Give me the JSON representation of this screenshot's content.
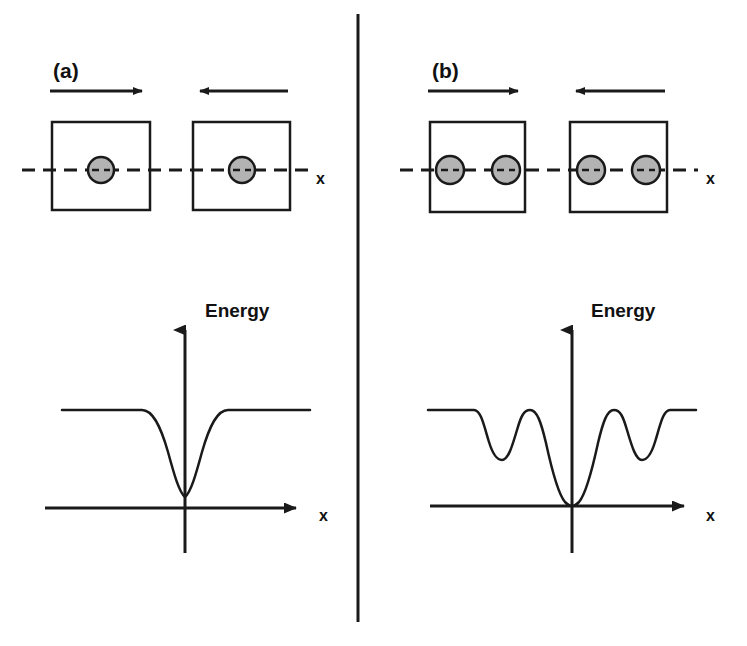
{
  "figure": {
    "background_color": "#ffffff",
    "stroke_color": "#1a1a1a",
    "particle_fill": "#b3b3b3",
    "particle_stroke": "#1a1a1a",
    "divider": {
      "name": "panel-divider",
      "x": 358,
      "y1": 14,
      "y2": 622,
      "width": 3
    }
  },
  "panels": [
    {
      "id": "a",
      "label": "(a)",
      "label_x": 53,
      "label_y": 78,
      "arrows": [
        {
          "name": "arrow-right",
          "direction": "right",
          "x1": 50,
          "x2": 148,
          "y": 91
        },
        {
          "name": "arrow-left",
          "direction": "left",
          "x1": 288,
          "x2": 194,
          "y": 91
        }
      ],
      "dashed_axis": {
        "name": "dashed-x-axis",
        "x1": 22,
        "x2": 308,
        "y": 170,
        "label": "x",
        "label_x": 316,
        "label_y": 184
      },
      "blocks": [
        {
          "name": "block-left",
          "x": 52,
          "y": 122,
          "width": 98,
          "height": 88,
          "particles": [
            {
              "name": "particle",
              "cx": 101,
              "cy": 170,
              "r": 13
            }
          ]
        },
        {
          "name": "block-right",
          "x": 193,
          "y": 122,
          "width": 97,
          "height": 88,
          "particles": [
            {
              "name": "particle",
              "cx": 242,
              "cy": 170,
              "r": 13
            }
          ]
        }
      ],
      "plot": {
        "name": "energy-plot-a",
        "energy_label": "Energy",
        "energy_label_x": 205,
        "energy_label_y": 317,
        "x_label": "x",
        "x_label_x": 319,
        "x_label_y": 521,
        "y_axis": {
          "x": 185,
          "y_top": 318,
          "y_bottom": 553
        },
        "x_axis": {
          "y": 508,
          "x_left": 45,
          "x_right": 308
        },
        "curve": "M62,410 L142,410 C152,410 160,424 168,452 C174,474 179,492 185,497 C191,492 196,474 202,452 C210,424 218,410 228,410 L310,410"
      },
      "chart_data": {
        "type": "line",
        "title": "Energy",
        "xlabel": "x",
        "ylabel": "Energy",
        "description": "Single commensurate contact: one broad potential well centered at x = 0, plateau at barrier height on both sides",
        "plateau_level": 1.0,
        "minimum_level": 0.12,
        "well_count": 1,
        "x": [
          -1.0,
          -0.62,
          -0.47,
          -0.32,
          -0.17,
          0.0,
          0.17,
          0.32,
          0.47,
          0.62,
          1.0
        ],
        "y": [
          1.0,
          1.0,
          0.84,
          0.55,
          0.22,
          0.12,
          0.22,
          0.55,
          0.84,
          1.0,
          1.0
        ]
      }
    },
    {
      "id": "b",
      "label": "(b)",
      "label_x": 432,
      "label_y": 78,
      "arrows": [
        {
          "name": "arrow-right",
          "direction": "right",
          "x1": 428,
          "x2": 524,
          "y": 91
        },
        {
          "name": "arrow-left",
          "direction": "left",
          "x1": 665,
          "x2": 570,
          "y": 91
        }
      ],
      "dashed_axis": {
        "name": "dashed-x-axis",
        "x1": 400,
        "x2": 698,
        "y": 170,
        "label": "x",
        "label_x": 706,
        "label_y": 184
      },
      "blocks": [
        {
          "name": "block-left",
          "x": 430,
          "y": 122,
          "width": 95,
          "height": 90,
          "particles": [
            {
              "name": "particle",
              "cx": 450,
              "cy": 170,
              "r": 14
            },
            {
              "name": "particle",
              "cx": 506,
              "cy": 170,
              "r": 14
            }
          ]
        },
        {
          "name": "block-right",
          "x": 570,
          "y": 122,
          "width": 97,
          "height": 90,
          "particles": [
            {
              "name": "particle",
              "cx": 591,
              "cy": 170,
              "r": 14
            },
            {
              "name": "particle",
              "cx": 646,
              "cy": 170,
              "r": 14
            }
          ]
        }
      ],
      "plot": {
        "name": "energy-plot-b",
        "energy_label": "Energy",
        "energy_label_x": 591,
        "energy_label_y": 317,
        "x_label": "x",
        "x_label_x": 706,
        "x_label_y": 521,
        "y_axis": {
          "x": 572,
          "y_top": 318,
          "y_bottom": 553
        },
        "x_axis": {
          "y": 506,
          "x_left": 430,
          "x_right": 696
        },
        "curve": "M428,410 L474,410 C481,410 484,426 489,442 C493,455 497,460 502,460 C508,460 512,447 517,430 C521,416 524,410 530,410 C537,410 541,422 546,443 C551,466 558,494 565,502 C568,505 570,506 572,506 C574,506 576,505 579,502 C586,494 593,466 598,443 C603,422 607,410 614,410 C620,410 623,416 627,430 C632,447 636,460 642,460 C647,460 651,455 655,442 C660,426 663,410 670,410 L696,410"
      },
      "chart_data": {
        "type": "line",
        "title": "Energy",
        "xlabel": "x",
        "ylabel": "Energy",
        "description": "Double asperity contact: deep central well at x = 0 flanked by two shallower side minima and two intermediate maxima at the plateau level",
        "plateau_level": 1.0,
        "minimum_level": 0.0,
        "side_minimum_level": 0.48,
        "well_count": 3,
        "x": [
          -1.0,
          -0.73,
          -0.62,
          -0.53,
          -0.46,
          -0.37,
          -0.28,
          -0.16,
          0.0,
          0.16,
          0.28,
          0.37,
          0.46,
          0.53,
          0.62,
          0.73,
          1.0
        ],
        "y": [
          1.0,
          1.0,
          0.82,
          0.48,
          0.48,
          0.78,
          1.0,
          0.72,
          0.0,
          0.72,
          1.0,
          0.78,
          0.48,
          0.48,
          0.82,
          1.0,
          1.0
        ]
      }
    }
  ]
}
